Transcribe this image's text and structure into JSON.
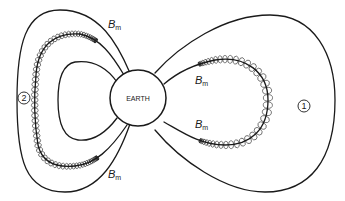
{
  "diagram": {
    "earth_label": "EARTH",
    "mirror_point_symbol": "B",
    "mirror_point_subscript": "m",
    "mirror_points": [
      {
        "id": "left-top",
        "text": "B",
        "sub": "m"
      },
      {
        "id": "left-bottom",
        "text": "B",
        "sub": "m"
      },
      {
        "id": "right-top",
        "text": "B",
        "sub": "m"
      },
      {
        "id": "right-bottom",
        "text": "B",
        "sub": "m"
      }
    ],
    "regions": [
      {
        "id": "region-1",
        "label": "1"
      },
      {
        "id": "region-2",
        "label": "2"
      }
    ],
    "colors": {
      "line": "#1a1a1a",
      "background": "#ffffff"
    }
  }
}
